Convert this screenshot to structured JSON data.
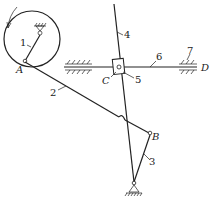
{
  "diagram": {
    "type": "mechanism-linkage",
    "points": {
      "A": "A",
      "B": "B",
      "C": "C",
      "D": "D"
    },
    "links": {
      "crank": "1",
      "coupler": "2",
      "rocker": "3",
      "guide_bar": "4",
      "slider": "5",
      "rod": "6",
      "guide": "7"
    },
    "rotation": "counterclockwise-arrow",
    "colors": {
      "line": "#222222",
      "background": "#ffffff"
    }
  }
}
